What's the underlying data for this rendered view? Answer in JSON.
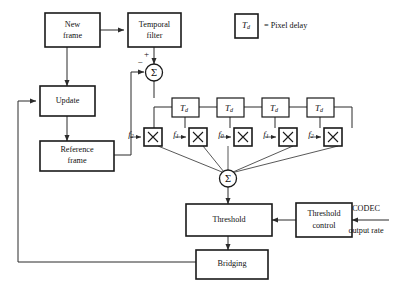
{
  "diagram": {
    "legend": {
      "symbol_main": "T",
      "symbol_sub": "d",
      "text": "= Pixel delay"
    },
    "blocks": [
      {
        "id": "new-frame",
        "label_line1": "New",
        "label_line2": "frame"
      },
      {
        "id": "temporal-filter",
        "label_line1": "Temporal",
        "label_line2": "filter"
      },
      {
        "id": "update",
        "label_line1": "Update",
        "label_line2": ""
      },
      {
        "id": "reference-frame",
        "label_line1": "Reference",
        "label_line2": "frame"
      },
      {
        "id": "threshold",
        "label_line1": "Threshold",
        "label_line2": ""
      },
      {
        "id": "threshold-control",
        "label_line1": "Threshold",
        "label_line2": "control"
      },
      {
        "id": "bridging",
        "label_line1": "Bridging",
        "label_line2": ""
      }
    ],
    "delays": [
      {
        "id": "delay-1",
        "main": "T",
        "sub": "d"
      },
      {
        "id": "delay-2",
        "main": "T",
        "sub": "d"
      },
      {
        "id": "delay-3",
        "main": "T",
        "sub": "d"
      },
      {
        "id": "delay-4",
        "main": "T",
        "sub": "d"
      }
    ],
    "multipliers": [
      {
        "id": "mult-1",
        "symbol": "X",
        "coefficient_main": "f",
        "coefficient_sub": "2"
      },
      {
        "id": "mult-2",
        "symbol": "X",
        "coefficient_main": "f",
        "coefficient_sub": "1"
      },
      {
        "id": "mult-3",
        "symbol": "X",
        "coefficient_main": "f",
        "coefficient_sub": "0"
      },
      {
        "id": "mult-4",
        "symbol": "X",
        "coefficient_main": "f",
        "coefficient_sub": "1"
      },
      {
        "id": "mult-5",
        "symbol": "X",
        "coefficient_main": "f",
        "coefficient_sub": "2"
      }
    ],
    "summing_junctions": [
      {
        "id": "sum-top",
        "symbol": "Σ",
        "sign_top": "+",
        "sign_left": "−"
      },
      {
        "id": "sum-bottom",
        "symbol": "Σ",
        "sign_top": "",
        "sign_left": ""
      }
    ],
    "external_input": {
      "line1": "CODEC",
      "line2": "output rate"
    }
  },
  "colors": {
    "background": "#ffffff",
    "stroke": "#1a1a1a",
    "wire": "#2b2b2b",
    "text": "#111111"
  }
}
